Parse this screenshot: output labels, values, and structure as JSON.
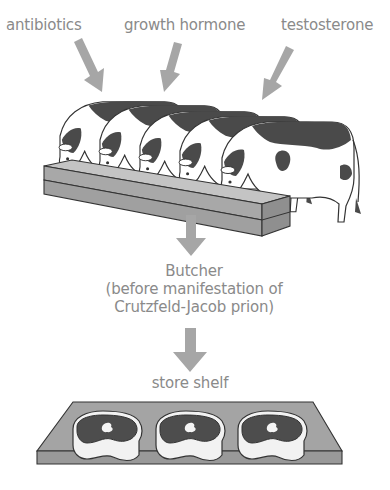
{
  "inputs": [
    {
      "label": "antibiotics"
    },
    {
      "label": "growth hormone"
    },
    {
      "label": "testosterone"
    }
  ],
  "stages": {
    "feedlot": {
      "description": "cows feeding at trough",
      "cow_count": 5
    },
    "butcher": {
      "line1": "Butcher",
      "line2": "(before manifestation of",
      "line3": "Crutzfeld-Jacob prion)"
    },
    "store": {
      "label": "store shelf",
      "steak_count": 3
    }
  },
  "colors": {
    "text": "#8a8a8a",
    "arrow": "#a6a6a6",
    "cow_spots": "#4a4a4a",
    "trough": "#a8a8a8",
    "shelf": "#a4a4a4",
    "steak_meat": "#4d4d4d",
    "steak_fat": "#f2f2f2"
  }
}
